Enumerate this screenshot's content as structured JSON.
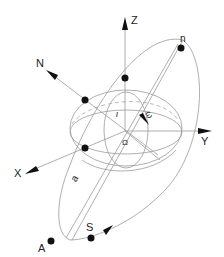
{
  "diagram": {
    "axes": {
      "z": "Z",
      "y": "Y",
      "x": "X",
      "n_normal": "N"
    },
    "points": {
      "periapsis": "n",
      "apoapsis": "A",
      "satellite": "S"
    },
    "angles": {
      "inclination": "ι",
      "argument_of_periapsis": "ω",
      "ascending_node": "Ω"
    },
    "semi_major_axis": "a",
    "colors": {
      "lines": "#9a9a9a",
      "points": "#111111",
      "background": "#ffffff"
    }
  }
}
